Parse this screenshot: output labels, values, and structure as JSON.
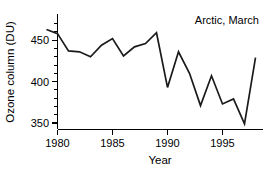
{
  "chart_data": {
    "type": "line",
    "title": "",
    "annotation": "Arctic, March",
    "xlabel": "Year",
    "ylabel": "Ozone column (DU)",
    "xlim": [
      1978.2,
      1998.8
    ],
    "ylim": [
      338,
      472
    ],
    "grid": false,
    "legend": null,
    "xticks": [
      1980,
      1985,
      1990,
      1995
    ],
    "xtick_labels": [
      "1980",
      "1985",
      "1990",
      "1995"
    ],
    "x_minor_ticks": [
      1979,
      1981,
      1982,
      1983,
      1984,
      1986,
      1987,
      1988,
      1989,
      1991,
      1992,
      1993,
      1994,
      1996,
      1997,
      1998
    ],
    "yticks": [
      350,
      400,
      450
    ],
    "ytick_labels": [
      "350",
      "400",
      "450"
    ],
    "y_minor_ticks": [
      340,
      350,
      360,
      370,
      380,
      390,
      400,
      410,
      420,
      430,
      440,
      450,
      460,
      470
    ],
    "line_color": "#1a1a1a",
    "x": [
      1979,
      1980,
      1981,
      1982,
      1983,
      1984,
      1985,
      1986,
      1987,
      1988,
      1989,
      1990,
      1991,
      1992,
      1993,
      1994,
      1995,
      1996,
      1997,
      1998
    ],
    "values": [
      463,
      458,
      437,
      436,
      430,
      444,
      452,
      431,
      442,
      446,
      459,
      393,
      436,
      410,
      371,
      407,
      373,
      379,
      349,
      429
    ],
    "series": [
      {
        "name": "Arctic, March ozone column",
        "values": [
          463,
          458,
          437,
          436,
          430,
          444,
          452,
          431,
          442,
          446,
          459,
          393,
          436,
          410,
          371,
          407,
          373,
          379,
          349,
          429
        ]
      }
    ]
  },
  "labels": {
    "xlabel": "Year",
    "ylabel": "Ozone column (DU)",
    "annotation": "Arctic, March",
    "xtick_0": "1980",
    "xtick_1": "1985",
    "xtick_2": "1990",
    "xtick_3": "1995",
    "ytick_0": "350",
    "ytick_1": "400",
    "ytick_2": "450"
  }
}
